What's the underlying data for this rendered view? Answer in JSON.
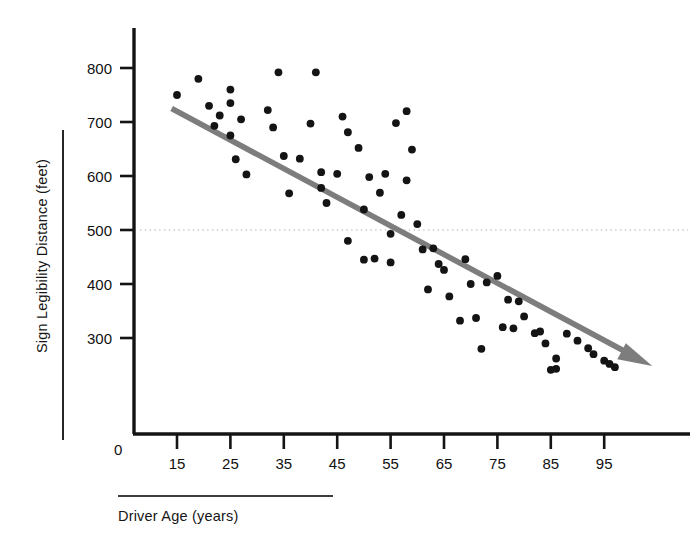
{
  "chart_data": {
    "type": "scatter",
    "title": "",
    "subtitle": "",
    "xlabel": "Driver Age (years)",
    "ylabel": "Sign Legibility Distance (feet)",
    "xlim": [
      5,
      108
    ],
    "ylim": [
      220,
      830
    ],
    "xticks": [
      15,
      25,
      35,
      45,
      55,
      65,
      75,
      85,
      95
    ],
    "yticks": [
      300,
      400,
      500,
      600,
      700,
      800
    ],
    "origin_label": "0",
    "grid": false,
    "legend": null,
    "reference_lines": [
      {
        "name": "dotted-500-line",
        "orientation": "horizontal",
        "value": 500,
        "style": "dotted",
        "color": "#c9c9c9"
      }
    ],
    "trendline": {
      "name": "regression-trend-arrow",
      "type": "linear",
      "color": "#7d7d7d",
      "x_start": 14,
      "y_start": 725,
      "x_end": 104,
      "y_end": 248,
      "arrowhead": true
    },
    "point_color": "#141414",
    "series": [
      {
        "name": "Drivers",
        "x": [
          15,
          19,
          21,
          23,
          22,
          25,
          25,
          25,
          26,
          27,
          28,
          32,
          33,
          34,
          35,
          36,
          38,
          40,
          41,
          42,
          42,
          43,
          45,
          46,
          47,
          47,
          49,
          50,
          50,
          51,
          52,
          53,
          54,
          55,
          55,
          56,
          57,
          58,
          58,
          59,
          60,
          61,
          62,
          63,
          64,
          65,
          66,
          68,
          69,
          70,
          71,
          72,
          73,
          75,
          76,
          77,
          78,
          79,
          80,
          82,
          83,
          84,
          85,
          86,
          86,
          88,
          90,
          92,
          93,
          95,
          96,
          97
        ],
        "y": [
          750,
          780,
          730,
          712,
          693,
          735,
          760,
          675,
          631,
          705,
          603,
          722,
          690,
          792,
          637,
          568,
          632,
          697,
          792,
          607,
          578,
          550,
          604,
          710,
          681,
          480,
          652,
          538,
          445,
          598,
          447,
          569,
          604,
          493,
          440,
          698,
          528,
          720,
          592,
          649,
          511,
          464,
          390,
          466,
          437,
          426,
          377,
          332,
          446,
          400,
          337,
          280,
          403,
          415,
          320,
          371,
          318,
          368,
          340,
          309,
          312,
          290,
          241,
          262,
          243,
          308,
          295,
          281,
          270,
          258,
          252,
          246
        ]
      }
    ]
  },
  "axes": {
    "y_tick_labels": [
      "800",
      "700",
      "600",
      "500",
      "400",
      "300"
    ],
    "x_tick_labels": [
      "15",
      "25",
      "35",
      "45",
      "55",
      "65",
      "75",
      "85",
      "95"
    ],
    "y_title": "Sign Legibility Distance (feet)",
    "x_title": "Driver Age (years)",
    "zero_label": "0"
  },
  "colors": {
    "axis": "#141414",
    "point": "#141414",
    "trendline": "#7d7d7d",
    "reference_dotted": "#cfcfcf",
    "background": "#ffffff"
  }
}
